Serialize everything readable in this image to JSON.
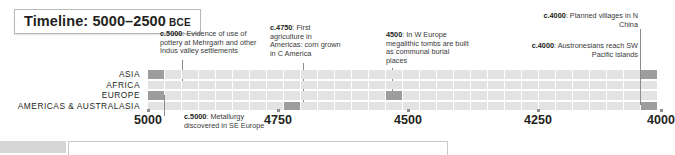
{
  "title": {
    "main": "Timeline: 5000–2500",
    "era": "BCE"
  },
  "notes": [
    {
      "id": "note-pottery-mehrgarh",
      "date": "c.5000",
      "text": ": Evidence of use of pottery at Mehrgarh and other Indus valley settlements"
    },
    {
      "id": "note-first-agriculture-americas",
      "date": "c.4750",
      "text": ": First agriculture in Americas: corn grown in C America"
    },
    {
      "id": "note-megalithic-tombs",
      "date": "4500",
      "text": ": In W Europe megalithic tombs are built as communal burial places"
    },
    {
      "id": "note-planned-villages-china",
      "date": "c.4000",
      "text": ": Planned villages in N China"
    },
    {
      "id": "note-austronesians-pacific",
      "date": "c.4000",
      "text": ": Austronesians reach SW Pacific islands"
    },
    {
      "id": "note-metallurgy-se-europe",
      "date": "c.5000",
      "text": ": Metallurgy discovered in SE Europe"
    }
  ],
  "rows": [
    {
      "label": "ASIA",
      "highlights": [
        0,
        29
      ]
    },
    {
      "label": "AFRICA",
      "highlights": []
    },
    {
      "label": "EUROPE",
      "highlights": [
        0,
        14
      ]
    },
    {
      "label": "AMERICAS & AUSTRALASIA",
      "highlights": [
        8,
        29
      ]
    }
  ],
  "axis": {
    "ticks": [
      {
        "label": "5000",
        "x": 148
      },
      {
        "label": "4750",
        "x": 278
      },
      {
        "label": "4500",
        "x": 408
      },
      {
        "label": "4250",
        "x": 538
      },
      {
        "label": "4000",
        "x": 661
      }
    ]
  },
  "colors": {
    "cell": "#e3e3e3",
    "cell_highlight": "#9d9d9d",
    "leader": "#8c8c8c",
    "text": "#231f20",
    "note_text": "#3a3a3a",
    "border": "#b9b9b9"
  },
  "columns": 30
}
